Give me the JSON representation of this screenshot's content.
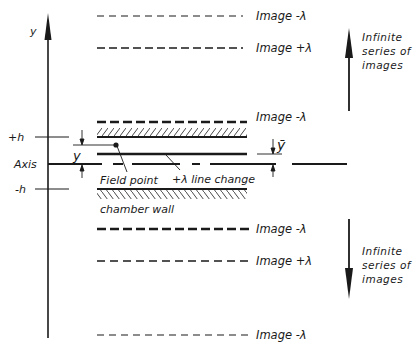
{
  "diagram": {
    "y_axis_label": "y",
    "plus_h_label": "+h",
    "axis_label": "Axis",
    "minus_h_label": "-h",
    "y_dim_label": "y",
    "ybar_label": "ȳ",
    "field_point_label": "Field point",
    "line_change_label": "+λ line change",
    "chamber_wall_label": "chamber wall",
    "images": [
      {
        "label": "Image -λ",
        "charge": "-λ",
        "style": "dashed-light"
      },
      {
        "label": "Image +λ",
        "charge": "+λ",
        "style": "dashed-medium"
      },
      {
        "label": "Image -λ",
        "charge": "-λ",
        "style": "dashed-heavy"
      },
      {
        "label": "Image -λ",
        "charge": "-λ",
        "style": "dashed-heavy"
      },
      {
        "label": "Image +λ",
        "charge": "+λ",
        "style": "dashed-medium"
      },
      {
        "label": "Image -λ",
        "charge": "-λ",
        "style": "dashed-light"
      }
    ],
    "upper_series_note": [
      "Infinite",
      "series of",
      "images"
    ],
    "lower_series_note": [
      "Infinite",
      "series of",
      "images"
    ]
  }
}
